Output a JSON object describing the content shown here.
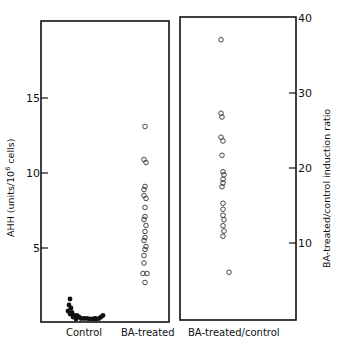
{
  "chart_data": [
    {
      "type": "scatter",
      "panel": "left",
      "title": "",
      "ylabel": "AHH (units/10⁶ cells)",
      "ylabel_main": "AHH (units/10",
      "ylabel_sup": "6",
      "ylabel_tail": " cells)",
      "ylim": [
        0,
        19
      ],
      "yticks": [
        5,
        10,
        15
      ],
      "ytick_labels": [
        "5",
        "10",
        "15"
      ],
      "grid": false,
      "categories": [
        "Control",
        "BA-treated"
      ],
      "series": [
        {
          "name": "Control",
          "marker": "filled-circle",
          "values": [
            1.6,
            1.2,
            1.0,
            0.8,
            0.7,
            0.6,
            0.5,
            0.5,
            0.4,
            0.4,
            0.3,
            0.3,
            0.3,
            0.2,
            0.2,
            0.2,
            0.2,
            0.3,
            0.3,
            0.4,
            0.5
          ]
        },
        {
          "name": "BA-treated",
          "marker": "open-circle",
          "values": [
            13.1,
            10.9,
            10.7,
            9.1,
            8.9,
            8.5,
            8.3,
            7.7,
            7.1,
            6.9,
            6.5,
            6.1,
            5.7,
            5.5,
            5.1,
            4.9,
            4.5,
            4.0,
            3.3,
            3.3,
            2.7
          ]
        }
      ]
    },
    {
      "type": "scatter",
      "panel": "right",
      "title": "",
      "ylabel": "BA-treated/control induction ratio",
      "ylim": [
        0,
        40
      ],
      "yticks": [
        10,
        20,
        30,
        40
      ],
      "ytick_labels": [
        "10",
        "20",
        "30",
        "40"
      ],
      "grid": false,
      "categories": [
        "BA-treated/control"
      ],
      "series": [
        {
          "name": "BA-treated/control",
          "marker": "open-circle",
          "values": [
            37.1,
            27.3,
            26.8,
            24.1,
            23.6,
            21.7,
            19.5,
            19.1,
            18.5,
            18.0,
            17.5,
            15.3,
            14.5,
            13.7,
            13.1,
            12.3,
            11.6,
            10.9,
            6.1
          ]
        }
      ]
    }
  ],
  "labels": {
    "left_y_title_main": "AHH (units/10",
    "left_y_title_sup": "6",
    "left_y_title_tail": " cells)",
    "right_y_title": "BA-treated/control induction ratio",
    "cat_control": "Control",
    "cat_ba_treated": "BA-treated",
    "cat_ratio": "BA-treated/control",
    "left_ticks": [
      "5",
      "10",
      "15"
    ],
    "right_ticks": [
      "10",
      "20",
      "30",
      "40"
    ]
  }
}
